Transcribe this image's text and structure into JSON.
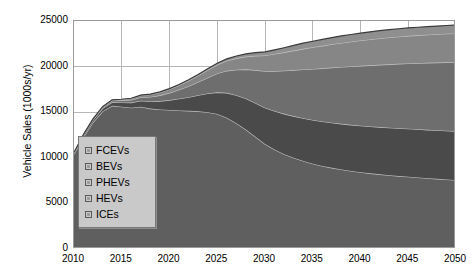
{
  "chart_data": {
    "type": "area",
    "stacked": true,
    "title": "",
    "xlabel": "",
    "ylabel": "Vehicle Sales (1000s/yr)",
    "xlim": [
      2010,
      2050
    ],
    "ylim": [
      0,
      25000
    ],
    "grid": true,
    "legend_position": "lower-left-inside",
    "x": [
      2010,
      2011,
      2012,
      2013,
      2014,
      2015,
      2016,
      2017,
      2018,
      2019,
      2020,
      2021,
      2022,
      2023,
      2024,
      2025,
      2026,
      2027,
      2028,
      2029,
      2030,
      2031,
      2032,
      2033,
      2034,
      2035,
      2036,
      2037,
      2038,
      2039,
      2040,
      2041,
      2042,
      2043,
      2044,
      2045,
      2046,
      2047,
      2048,
      2049,
      2050
    ],
    "xticks": [
      2010,
      2015,
      2020,
      2025,
      2030,
      2035,
      2040,
      2045,
      2050
    ],
    "yticks": [
      0,
      5000,
      10000,
      15000,
      20000,
      25000
    ],
    "series": [
      {
        "name": "ICEs",
        "color": "#5f5f5f",
        "values": [
          10400,
          12300,
          13900,
          15100,
          15700,
          15600,
          15500,
          15600,
          15400,
          15300,
          15250,
          15200,
          15150,
          15100,
          15000,
          14800,
          14400,
          13800,
          13100,
          12300,
          11500,
          10900,
          10400,
          10000,
          9650,
          9350,
          9100,
          8900,
          8720,
          8560,
          8420,
          8300,
          8190,
          8090,
          8000,
          7920,
          7840,
          7760,
          7690,
          7620,
          7550
        ]
      },
      {
        "name": "HEVs",
        "color": "#4a4a4a",
        "values": [
          150,
          200,
          260,
          330,
          400,
          470,
          560,
          660,
          780,
          920,
          1080,
          1280,
          1500,
          1760,
          2050,
          2380,
          2720,
          3060,
          3400,
          3720,
          4000,
          4230,
          4420,
          4570,
          4700,
          4800,
          4880,
          4950,
          5010,
          5060,
          5100,
          5140,
          5180,
          5210,
          5240,
          5270,
          5290,
          5310,
          5330,
          5350,
          5370
        ]
      },
      {
        "name": "PHEVs",
        "color": "#6e6e6e",
        "values": [
          30,
          50,
          80,
          120,
          170,
          230,
          300,
          390,
          500,
          630,
          790,
          980,
          1200,
          1450,
          1740,
          2060,
          2420,
          2800,
          3200,
          3600,
          4000,
          4380,
          4730,
          5050,
          5340,
          5600,
          5830,
          6040,
          6230,
          6400,
          6560,
          6700,
          6830,
          6950,
          7060,
          7160,
          7250,
          7340,
          7420,
          7500,
          7570
        ]
      },
      {
        "name": "BEVs",
        "color": "#868686",
        "values": [
          10,
          20,
          35,
          55,
          80,
          110,
          150,
          200,
          260,
          330,
          410,
          500,
          600,
          710,
          830,
          960,
          1100,
          1250,
          1400,
          1560,
          1720,
          1870,
          2010,
          2140,
          2260,
          2370,
          2470,
          2560,
          2640,
          2710,
          2780,
          2840,
          2890,
          2940,
          2980,
          3020,
          3050,
          3080,
          3110,
          3140,
          3160
        ]
      },
      {
        "name": "FCEVs",
        "color": "#8f8f8f",
        "values": [
          0,
          0,
          0,
          2,
          5,
          10,
          16,
          24,
          34,
          46,
          60,
          78,
          98,
          120,
          145,
          175,
          210,
          250,
          295,
          345,
          400,
          455,
          510,
          565,
          615,
          660,
          700,
          735,
          765,
          790,
          810,
          830,
          845,
          858,
          868,
          876,
          882,
          887,
          891,
          894,
          896
        ]
      }
    ]
  },
  "axes": {
    "ylabel": "Vehicle Sales (1000s/yr)",
    "ytick_labels": [
      "25000",
      "20000",
      "15000",
      "10000",
      "5000",
      "0"
    ],
    "xtick_labels": [
      "2010",
      "2015",
      "2020",
      "2025",
      "2030",
      "2035",
      "2040",
      "2045",
      "2050"
    ]
  },
  "legend": {
    "items": [
      {
        "label": "FCEVs"
      },
      {
        "label": "BEVs"
      },
      {
        "label": "PHEVs"
      },
      {
        "label": "HEVs"
      },
      {
        "label": "ICEs"
      }
    ]
  },
  "colors": {
    "grid": "#b6b6b6",
    "frame": "#9a9a9a",
    "legend_bg": "#c9c9c9",
    "background": "#ffffff"
  }
}
